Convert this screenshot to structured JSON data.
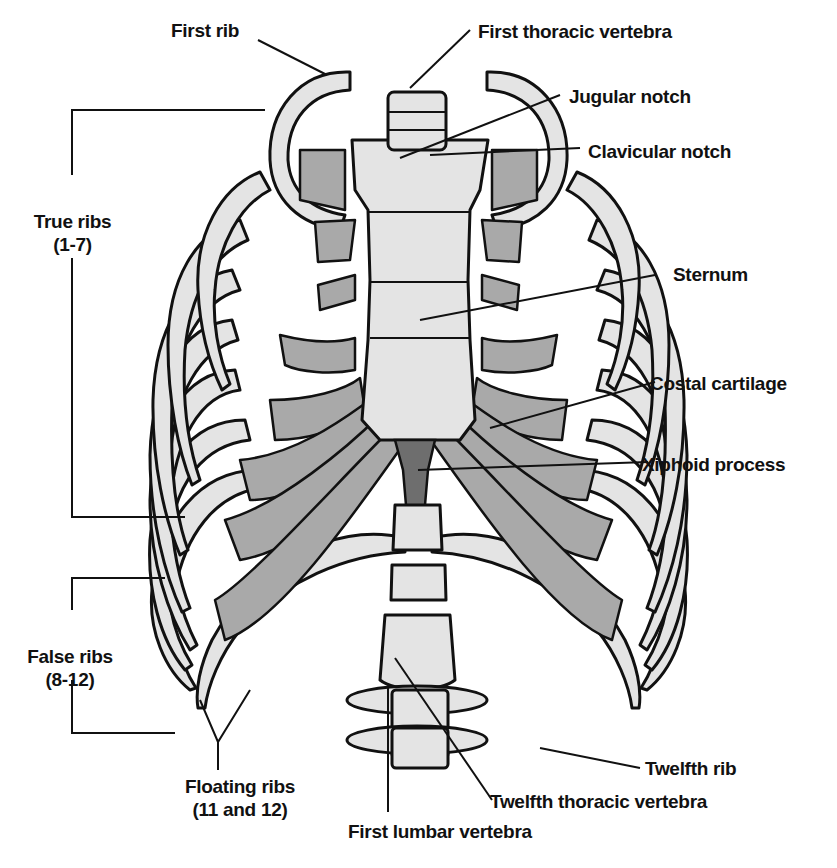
{
  "diagram": {
    "type": "anatomical-illustration",
    "colors": {
      "bone": "#e4e4e4",
      "cartilage": "#a9a9a9",
      "xiphoid": "#6e6e6e",
      "outline": "#111111",
      "background": "#ffffff"
    },
    "labels": {
      "first_rib": "First rib",
      "first_thoracic_vertebra": "First thoracic vertebra",
      "jugular_notch": "Jugular notch",
      "clavicular_notch": "Clavicular notch",
      "true_ribs": "True ribs",
      "true_ribs_range": "(1-7)",
      "sternum": "Sternum",
      "costal_cartilage": "Costal cartilage",
      "xiphoid_process": "Xiphoid process",
      "false_ribs": "False ribs",
      "false_ribs_range": "(8-12)",
      "floating_ribs": "Floating ribs",
      "floating_ribs_range": "(11 and 12)",
      "twelfth_rib": "Twelfth rib",
      "twelfth_thoracic_vertebra": "Twelfth thoracic vertebra",
      "first_lumbar_vertebra": "First lumbar vertebra"
    }
  }
}
